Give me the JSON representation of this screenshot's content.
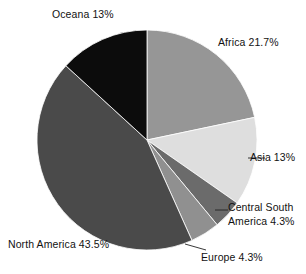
{
  "chart_data": {
    "type": "pie",
    "title": "",
    "subtitle": "",
    "xlabel": "",
    "ylabel": "",
    "legend_position": "none",
    "grid": false,
    "start_angle_deg": 0,
    "direction": "clockwise",
    "categories": [
      "Africa",
      "Asia",
      "Central South America",
      "Europe",
      "North America",
      "Oceana"
    ],
    "values": [
      21.7,
      13,
      4.3,
      4.3,
      43.5,
      13
    ],
    "unit": "%",
    "slices": [
      {
        "name": "Africa",
        "value": 21.7,
        "label": "Africa 21.7%",
        "label_lines": [
          "Africa 21.7%"
        ],
        "color": "#969696",
        "start_deg": 0.0,
        "end_deg": 78.12
      },
      {
        "name": "Asia",
        "value": 13.0,
        "label": "Asia 13%",
        "label_lines": [
          "Asia 13%"
        ],
        "color": "#dedede",
        "start_deg": 78.12,
        "end_deg": 124.92
      },
      {
        "name": "Central South America",
        "value": 4.3,
        "label": "Central South America 4.3%",
        "label_lines": [
          "Central South",
          "America 4.3%"
        ],
        "color": "#6b6b6b",
        "start_deg": 124.92,
        "end_deg": 140.4
      },
      {
        "name": "Europe",
        "value": 4.3,
        "label": "Europe 4.3%",
        "label_lines": [
          "Europe 4.3%"
        ],
        "color": "#909090",
        "start_deg": 140.4,
        "end_deg": 155.88
      },
      {
        "name": "North America",
        "value": 43.5,
        "label": "North America 43.5%",
        "label_lines": [
          "North America 43.5%"
        ],
        "color": "#4a4a4a",
        "start_deg": 155.88,
        "end_deg": 312.48
      },
      {
        "name": "Oceana",
        "value": 13.0,
        "label": "Oceana 13%",
        "label_lines": [
          "Oceana 13%"
        ],
        "color": "#0c0c0c",
        "start_deg": 312.48,
        "end_deg": 360.0
      }
    ],
    "geometry": {
      "cx": 147,
      "cy": 140,
      "r": 110
    },
    "background_color": "#ffffff"
  },
  "labels": {
    "oceana": "Oceana 13%",
    "africa": "Africa 21.7%",
    "asia": "Asia 13%",
    "central_south_line1": "Central South",
    "central_south_line2": "America 4.3%",
    "europe": "Europe 4.3%",
    "north_america": "North America 43.5%"
  }
}
